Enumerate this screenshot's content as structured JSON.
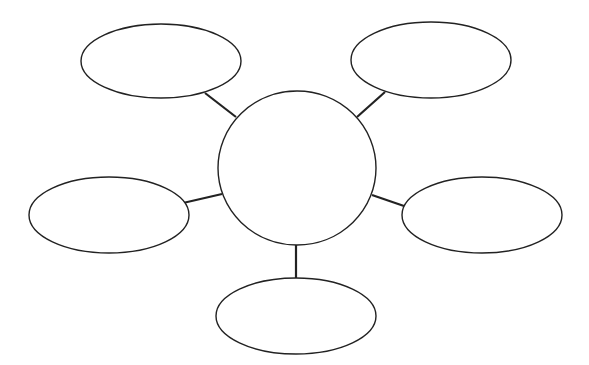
{
  "diagram": {
    "type": "spider-map",
    "background": "#ffffff",
    "stroke": "#222222",
    "center": {
      "cx": 297,
      "cy": 168,
      "rx": 79,
      "ry": 77,
      "label": ""
    },
    "nodes": [
      {
        "id": "top-left",
        "cx": 161,
        "cy": 61,
        "rx": 80,
        "ry": 37,
        "label": ""
      },
      {
        "id": "top-right",
        "cx": 431,
        "cy": 60,
        "rx": 80,
        "ry": 38,
        "label": ""
      },
      {
        "id": "middle-left",
        "cx": 109,
        "cy": 215,
        "rx": 80,
        "ry": 38,
        "label": ""
      },
      {
        "id": "middle-right",
        "cx": 482,
        "cy": 215,
        "rx": 80,
        "ry": 38,
        "label": ""
      },
      {
        "id": "bottom",
        "cx": 296,
        "cy": 316,
        "rx": 80,
        "ry": 38,
        "label": ""
      }
    ],
    "connectors": [
      {
        "id": "top-left",
        "x1": 205,
        "y1": 93,
        "x2": 236,
        "y2": 117
      },
      {
        "id": "top-right",
        "x1": 385,
        "y1": 92,
        "x2": 357,
        "y2": 117
      },
      {
        "id": "middle-left",
        "x1": 183,
        "y1": 203,
        "x2": 222,
        "y2": 194
      },
      {
        "id": "middle-right",
        "x1": 404,
        "y1": 206,
        "x2": 372,
        "y2": 195
      },
      {
        "id": "bottom",
        "x1": 296,
        "y1": 245,
        "x2": 296,
        "y2": 278
      }
    ]
  }
}
